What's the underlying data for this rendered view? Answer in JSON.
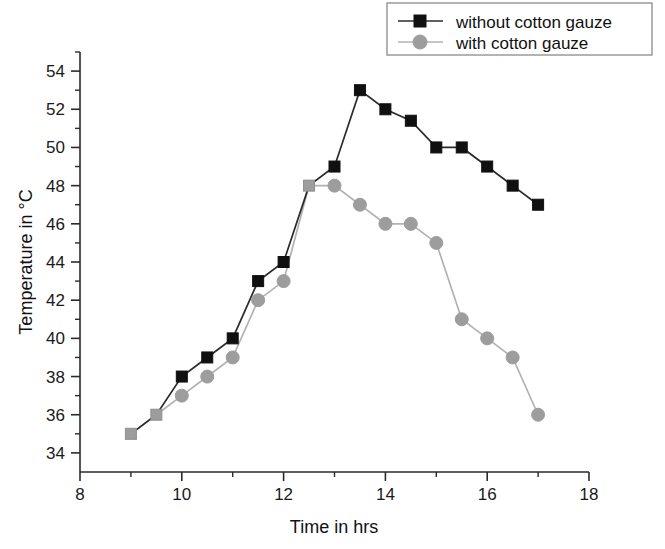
{
  "chart_data": {
    "type": "line",
    "title": "",
    "xlabel": "Time in hrs",
    "ylabel": "Temperature in °C",
    "xlim": [
      8,
      18
    ],
    "ylim": [
      33,
      55
    ],
    "xticks": [
      8,
      10,
      12,
      14,
      16,
      18
    ],
    "xtick_labels": [
      "8",
      "10",
      "12",
      "14",
      "16",
      "18"
    ],
    "xminor_ticks": [
      9,
      11,
      13,
      15,
      17
    ],
    "yticks": [
      34,
      36,
      38,
      40,
      42,
      44,
      46,
      48,
      50,
      52,
      54
    ],
    "ytick_labels": [
      "34",
      "36",
      "38",
      "40",
      "42",
      "44",
      "46",
      "48",
      "50",
      "52",
      "54"
    ],
    "yminor_ticks": [
      35,
      37,
      39,
      41,
      43,
      45,
      47,
      49,
      51,
      53,
      55
    ],
    "grid": false,
    "legend_position": "top-right",
    "series": [
      {
        "name": "without cotton gauze",
        "marker": "square",
        "color": "#101010",
        "x": [
          9,
          9.5,
          10,
          10.5,
          11,
          11.5,
          12,
          12.5,
          13,
          13.5,
          14,
          14.5,
          15,
          15.5,
          16,
          16.5,
          17
        ],
        "values": [
          35,
          36,
          38,
          39,
          40,
          43,
          44,
          48,
          49,
          53,
          52,
          51.4,
          50,
          50,
          49,
          48,
          47
        ]
      },
      {
        "name": "with cotton gauze",
        "marker": "circle",
        "color": "#9d9d9d",
        "x": [
          9,
          9.5,
          10,
          10.5,
          11,
          11.5,
          12,
          12.5,
          13,
          13.5,
          14,
          14.5,
          15,
          15.5,
          16,
          16.5,
          17
        ],
        "values": [
          35,
          36,
          37,
          38,
          39,
          42,
          43,
          48,
          48,
          47,
          46,
          46,
          45,
          41,
          40,
          39,
          36
        ]
      }
    ]
  },
  "legend": {
    "entries": [
      {
        "label": "without cotton gauze"
      },
      {
        "label": "with cotton gauze"
      }
    ]
  }
}
